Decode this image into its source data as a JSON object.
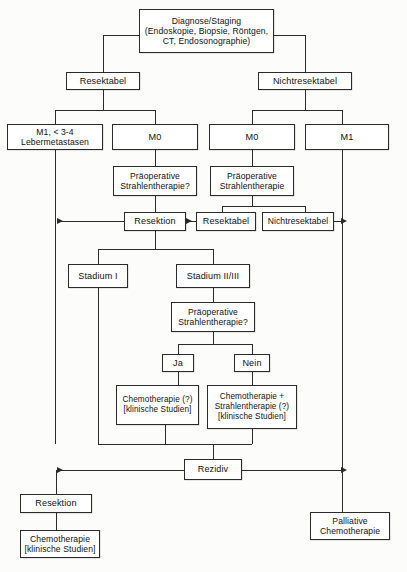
{
  "diagram": {
    "language": "de",
    "line_color": "#2b2b2b",
    "box_fill": "#ffffff",
    "nodes": {
      "diagnose": "Diagnose/Staging\n(Endoskopie, Biopsie, Röntgen,\nCT, Endosonographie)",
      "resektabel_top": "Resektabel",
      "nichtresektabel_top": "Nichtresektabel",
      "m1_leber": "M1, < 3-4\nLebermetastasen",
      "m0_left": "M0",
      "m0_right": "M0",
      "m1_right": "M1",
      "praeop_left": "Präoperative\nStrahlentherapie?",
      "praeop_right": "Präoperative\nStrahlentherapie",
      "resektion_mid": "Resektion",
      "resektabel_mid": "Resektabel",
      "nichtresektabel_mid": "Nichtresektabel",
      "stadium_1": "Stadium I",
      "stadium_2_3": "Stadium II/III",
      "praeop_lower": "Präoperative\nStrahlentherapie?",
      "ja": "Ja",
      "nein": "Nein",
      "chemo_q": "Chemotherapie (?)\n[klinische Studien]",
      "chemo_strahlen_q": "Chemotherapie +\nStrahlentherapie (?)\n[klinische Studien]",
      "rezidiv": "Rezidiv",
      "resektion_bottom": "Resektion",
      "chemo_bottom": "Chemotherapie\n[klinische Studien]",
      "palliative_chemo": "Palliative\nChemotherapie"
    }
  }
}
